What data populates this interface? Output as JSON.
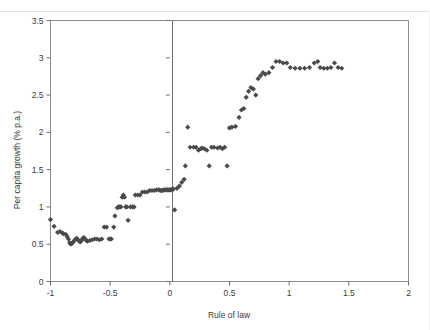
{
  "figure": {
    "background_color": "#ffffff",
    "marker_color": "#4a4a4a",
    "axis_color": "#6e6e6e",
    "frame_color": "#8c8c8c"
  },
  "axes": {
    "x_title": "Rule of law",
    "y_title": "Per capita growth (% p.a.)",
    "x_ticks": [
      "-1",
      "-0.5",
      "0",
      "0.5",
      "1",
      "1.5",
      "2"
    ],
    "x_tick_values": [
      -1,
      -0.5,
      0,
      0.5,
      1,
      1.5,
      2
    ],
    "y_ticks": [
      "0",
      "0.5",
      "1",
      "1.5",
      "2",
      "2.5",
      "3",
      "3.5"
    ],
    "y_tick_values": [
      0,
      0.5,
      1,
      1.5,
      2,
      2.5,
      3,
      3.5
    ]
  },
  "chart_data": {
    "type": "scatter",
    "title": "",
    "xlabel": "Rule of law",
    "ylabel": "Per capita growth (% p.a.)",
    "xlim": [
      -1,
      2
    ],
    "ylim": [
      0,
      3.5
    ],
    "grid": false,
    "legend": null,
    "marker_style": "diamond",
    "series": [
      {
        "name": "Per capita growth vs Rule of law",
        "points": [
          [
            -1.0,
            0.83
          ],
          [
            -0.97,
            0.74
          ],
          [
            -0.94,
            0.66
          ],
          [
            -0.92,
            0.67
          ],
          [
            -0.9,
            0.65
          ],
          [
            -0.89,
            0.64
          ],
          [
            -0.87,
            0.63
          ],
          [
            -0.86,
            0.6
          ],
          [
            -0.85,
            0.57
          ],
          [
            -0.84,
            0.52
          ],
          [
            -0.83,
            0.5
          ],
          [
            -0.82,
            0.51
          ],
          [
            -0.81,
            0.53
          ],
          [
            -0.8,
            0.55
          ],
          [
            -0.79,
            0.57
          ],
          [
            -0.78,
            0.58
          ],
          [
            -0.77,
            0.56
          ],
          [
            -0.76,
            0.54
          ],
          [
            -0.75,
            0.53
          ],
          [
            -0.74,
            0.55
          ],
          [
            -0.73,
            0.58
          ],
          [
            -0.72,
            0.59
          ],
          [
            -0.71,
            0.57
          ],
          [
            -0.7,
            0.55
          ],
          [
            -0.69,
            0.54
          ],
          [
            -0.67,
            0.55
          ],
          [
            -0.65,
            0.56
          ],
          [
            -0.63,
            0.57
          ],
          [
            -0.61,
            0.57
          ],
          [
            -0.59,
            0.56
          ],
          [
            -0.57,
            0.57
          ],
          [
            -0.55,
            0.73
          ],
          [
            -0.53,
            0.73
          ],
          [
            -0.51,
            0.57
          ],
          [
            -0.5,
            0.57
          ],
          [
            -0.49,
            0.57
          ],
          [
            -0.47,
            0.73
          ],
          [
            -0.46,
            0.88
          ],
          [
            -0.44,
            0.99
          ],
          [
            -0.43,
            1.0
          ],
          [
            -0.42,
            1.0
          ],
          [
            -0.41,
            1.0
          ],
          [
            -0.4,
            1.13
          ],
          [
            -0.39,
            1.16
          ],
          [
            -0.38,
            1.13
          ],
          [
            -0.37,
            1.0
          ],
          [
            -0.36,
            1.0
          ],
          [
            -0.35,
            0.82
          ],
          [
            -0.33,
            1.0
          ],
          [
            -0.31,
            1.0
          ],
          [
            -0.3,
            1.0
          ],
          [
            -0.29,
            1.16
          ],
          [
            -0.27,
            1.16
          ],
          [
            -0.25,
            1.16
          ],
          [
            -0.23,
            1.2
          ],
          [
            -0.21,
            1.2
          ],
          [
            -0.19,
            1.2
          ],
          [
            -0.17,
            1.22
          ],
          [
            -0.15,
            1.22
          ],
          [
            -0.13,
            1.22
          ],
          [
            -0.11,
            1.23
          ],
          [
            -0.09,
            1.23
          ],
          [
            -0.08,
            1.22
          ],
          [
            -0.07,
            1.22
          ],
          [
            -0.06,
            1.22
          ],
          [
            -0.05,
            1.23
          ],
          [
            -0.04,
            1.23
          ],
          [
            -0.03,
            1.23
          ],
          [
            -0.02,
            1.23
          ],
          [
            -0.01,
            1.23
          ],
          [
            0.0,
            1.23
          ],
          [
            0.01,
            1.23
          ],
          [
            0.02,
            1.24
          ],
          [
            0.03,
            1.24
          ],
          [
            0.04,
            0.96
          ],
          [
            0.06,
            1.25
          ],
          [
            0.08,
            1.28
          ],
          [
            0.1,
            1.33
          ],
          [
            0.12,
            1.37
          ],
          [
            0.13,
            1.55
          ],
          [
            0.15,
            2.07
          ],
          [
            0.17,
            1.8
          ],
          [
            0.2,
            1.8
          ],
          [
            0.22,
            1.8
          ],
          [
            0.24,
            1.76
          ],
          [
            0.26,
            1.78
          ],
          [
            0.27,
            1.79
          ],
          [
            0.29,
            1.78
          ],
          [
            0.31,
            1.76
          ],
          [
            0.33,
            1.55
          ],
          [
            0.35,
            1.8
          ],
          [
            0.37,
            1.8
          ],
          [
            0.4,
            1.79
          ],
          [
            0.42,
            1.8
          ],
          [
            0.44,
            1.78
          ],
          [
            0.46,
            1.8
          ],
          [
            0.48,
            1.55
          ],
          [
            0.5,
            2.06
          ],
          [
            0.52,
            2.07
          ],
          [
            0.55,
            2.08
          ],
          [
            0.58,
            2.2
          ],
          [
            0.6,
            2.3
          ],
          [
            0.62,
            2.32
          ],
          [
            0.64,
            2.47
          ],
          [
            0.66,
            2.55
          ],
          [
            0.68,
            2.6
          ],
          [
            0.7,
            2.58
          ],
          [
            0.72,
            2.5
          ],
          [
            0.74,
            2.72
          ],
          [
            0.76,
            2.76
          ],
          [
            0.78,
            2.8
          ],
          [
            0.8,
            2.78
          ],
          [
            0.83,
            2.8
          ],
          [
            0.86,
            2.87
          ],
          [
            0.89,
            2.95
          ],
          [
            0.92,
            2.95
          ],
          [
            0.95,
            2.93
          ],
          [
            0.98,
            2.93
          ],
          [
            1.01,
            2.87
          ],
          [
            1.05,
            2.86
          ],
          [
            1.09,
            2.86
          ],
          [
            1.13,
            2.86
          ],
          [
            1.17,
            2.87
          ],
          [
            1.21,
            2.93
          ],
          [
            1.24,
            2.95
          ],
          [
            1.26,
            2.87
          ],
          [
            1.29,
            2.86
          ],
          [
            1.32,
            2.86
          ],
          [
            1.35,
            2.87
          ],
          [
            1.38,
            2.93
          ],
          [
            1.41,
            2.87
          ],
          [
            1.44,
            2.86
          ]
        ]
      }
    ]
  }
}
